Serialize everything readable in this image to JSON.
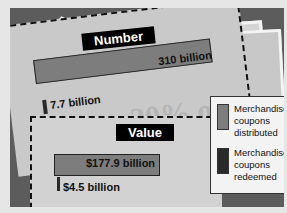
{
  "chart_data": {
    "type": "bar",
    "title": "",
    "panels": [
      {
        "title": "Number",
        "categories": [
          "Merchandise coupons distributed",
          "Merchandise coupons redeemed"
        ],
        "values": [
          310,
          7.7
        ],
        "labels": [
          "310 billion",
          "7.7 billion"
        ],
        "unit": "billion"
      },
      {
        "title": "Value",
        "categories": [
          "Merchandise coupons distributed",
          "Merchandise coupons redeemed"
        ],
        "values": [
          177.9,
          4.5
        ],
        "labels": [
          "$177.9 billion",
          "$4.5 billion"
        ],
        "unit": "billion USD"
      }
    ],
    "series": [
      {
        "name": "Merchandise coupons distributed",
        "values": [
          310,
          177.9
        ],
        "color": "#7d7d7d"
      },
      {
        "name": "Merchandise coupons redeemed",
        "values": [
          7.7,
          4.5
        ],
        "color": "#2a2a2a"
      }
    ],
    "orientation": "horizontal",
    "legend_position": "right",
    "grid": false
  },
  "panels": {
    "number": {
      "title": "Number",
      "distributed_label": "310 billion",
      "redeemed_label": "7.7 billion"
    },
    "value": {
      "title": "Value",
      "distributed_label": "$177.9 billion",
      "redeemed_label": "$4.5 billion"
    }
  },
  "legend": {
    "items": [
      {
        "label": "Merchandise coupons distributed",
        "color": "#7d7d7d"
      },
      {
        "label": "Merchandise coupons redeemed",
        "color": "#2a2a2a"
      }
    ]
  },
  "background": {
    "watermark": "20% off"
  }
}
